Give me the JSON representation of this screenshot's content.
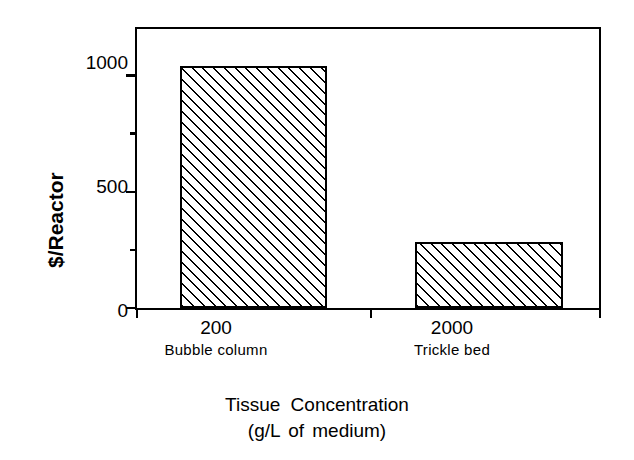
{
  "chart_data": {
    "type": "bar",
    "title": "",
    "subtitle": "",
    "xlabel": "Tissue Concentration",
    "xlabel_line2": "(g/L of medium)",
    "ylabel": "$/Reactor",
    "categories": [
      "200",
      "2000"
    ],
    "category_names": [
      "Bubble column",
      "Trickle bed"
    ],
    "values": [
      1040,
      282
    ],
    "ylim": [
      0,
      1200
    ],
    "ytick_major_values": [
      0,
      500,
      1000
    ],
    "ytick_major_labels": [
      "0",
      "500",
      "1000"
    ],
    "ytick_minor_values": [
      250,
      750
    ],
    "xtick_positions": [
      0,
      50,
      100
    ],
    "grid": false,
    "legend": false,
    "bar_fill": "hatch-45",
    "bar_edge_color": "#000000",
    "axes_color": "#000000",
    "background_color": "#ffffff"
  },
  "axes": {
    "y_title": "$/Reactor",
    "x_title_line1": "Tissue Concentration",
    "x_title_line2": "(g/L of medium)"
  },
  "ticks": {
    "y": [
      {
        "label": "1000",
        "value": 1000
      },
      {
        "label": "500",
        "value": 500
      },
      {
        "label": "0",
        "value": 0
      }
    ]
  },
  "bars": [
    {
      "category": "200",
      "name": "Bubble column",
      "value": 1040
    },
    {
      "category": "2000",
      "name": "Trickle bed",
      "value": 282
    }
  ]
}
